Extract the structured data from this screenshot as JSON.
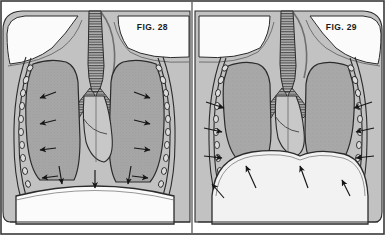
{
  "plate": {
    "title": "Thoracic respiration mechanics plate",
    "width": 385,
    "height": 235,
    "border_color": "#3a3a3a",
    "paper_color": "#ffffff"
  },
  "panels": [
    {
      "id": "fig-28",
      "label": "FIG. 28",
      "label_x": 168,
      "label_y": 30,
      "phase": "inspiration",
      "diaphragm_state": "flattened-descended",
      "ribcage_state": "expanded",
      "arrow_count": 11,
      "arrow_direction_summary": "inward-and-downward",
      "side": "left"
    },
    {
      "id": "fig-29",
      "label": "FIG. 29",
      "label_x": 357,
      "label_y": 30,
      "phase": "expiration",
      "diaphragm_state": "domed-elevated",
      "ribcage_state": "contracted",
      "arrow_count": 10,
      "arrow_direction_summary": "inward-and-upward",
      "side": "right"
    }
  ],
  "colors": {
    "body_gray": "#c2c2c2",
    "lung_gray": "#a6a6a6",
    "heart_gray": "#c8c8c8",
    "diaphragm_light": "#f2f2f2",
    "white_tissue": "#fbfbfb",
    "outline": "#2b2b2b",
    "trachea_fill": "#b4b4b4",
    "rib_fill": "#dcdcdc",
    "arrow_color": "#161616",
    "divider": "#4a4a4a"
  },
  "structures": [
    {
      "name": "trachea",
      "description": "central airway with horizontal cartilage rings"
    },
    {
      "name": "bronchi",
      "description": "branching left and right main bronchi"
    },
    {
      "name": "left-lung",
      "description": "stippled gray lung field"
    },
    {
      "name": "right-lung",
      "description": "stippled gray lung field"
    },
    {
      "name": "heart",
      "description": "central lighter gray cardiac silhouette"
    },
    {
      "name": "diaphragm",
      "description": "curved muscular sheet below lungs"
    },
    {
      "name": "ribs",
      "description": "chain of oval rib cross-sections along the chest wall"
    },
    {
      "name": "clavicle-shoulder",
      "description": "white shoulder and clavicle regions at top"
    }
  ]
}
